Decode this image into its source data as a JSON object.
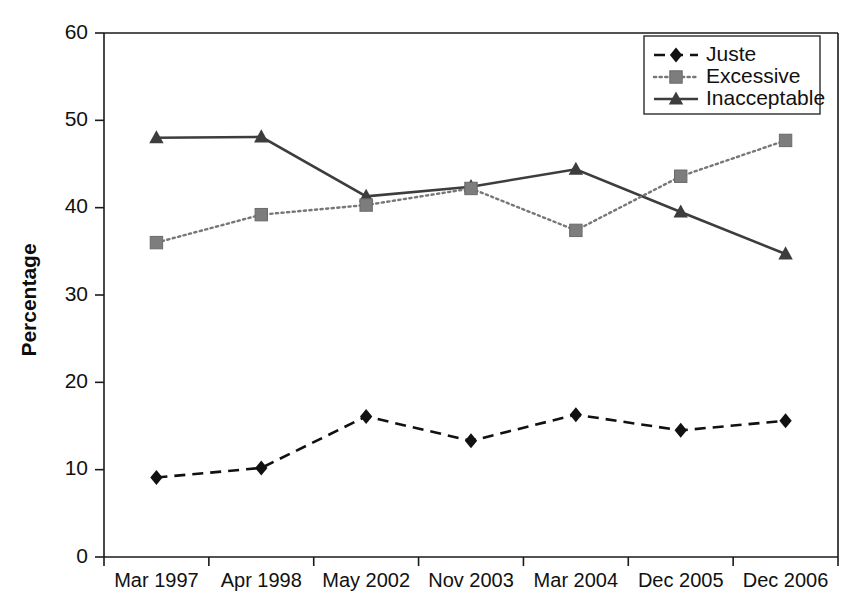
{
  "chart_data": {
    "type": "line",
    "title": "",
    "xlabel": "",
    "ylabel": "Percentage",
    "ylim": [
      0,
      60
    ],
    "yticks": [
      0,
      10,
      20,
      30,
      40,
      50,
      60
    ],
    "grid": false,
    "legend_position": "top-right",
    "categories": [
      "Mar 1997",
      "Apr 1998",
      "May 2002",
      "Nov 2003",
      "Mar 2004",
      "Dec 2005",
      "Dec 2006"
    ],
    "series": [
      {
        "name": "Juste",
        "marker": "diamond",
        "linestyle": "dashed",
        "color": "#111111",
        "values": [
          9.1,
          10.2,
          16.1,
          13.3,
          16.3,
          14.5,
          15.6
        ]
      },
      {
        "name": "Excessive",
        "marker": "square",
        "linestyle": "dotted",
        "color": "#7d7d7d",
        "values": [
          36.0,
          39.2,
          40.3,
          42.2,
          37.4,
          43.6,
          47.7
        ]
      },
      {
        "name": "Inacceptable",
        "marker": "triangle",
        "linestyle": "solid",
        "color": "#3d3d3d",
        "values": [
          48.0,
          48.1,
          41.3,
          42.4,
          44.4,
          39.5,
          34.7
        ]
      }
    ]
  },
  "axes": {
    "y_label": "Percentage",
    "y_tick_labels": [
      "0",
      "10",
      "20",
      "30",
      "40",
      "50",
      "60"
    ],
    "x_tick_labels": [
      "Mar 1997",
      "Apr 1998",
      "May 2002",
      "Nov 2003",
      "Mar 2004",
      "Dec 2005",
      "Dec 2006"
    ]
  },
  "legend": {
    "entries": [
      {
        "label": "Juste"
      },
      {
        "label": "Excessive"
      },
      {
        "label": "Inacceptable"
      }
    ]
  },
  "colors": {
    "juste": "#111111",
    "excessive": "#7d7d7d",
    "inacceptable": "#3d3d3d",
    "axis": "#1a1a1a",
    "background": "#ffffff"
  }
}
